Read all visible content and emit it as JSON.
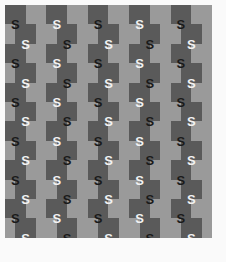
{
  "figure": {
    "width": 226,
    "height": 262,
    "background_color": "#fafafa"
  },
  "pattern": {
    "origin_x": 5,
    "origin_y": 5,
    "width": 207,
    "height": 233,
    "cell_width": 20.7,
    "cell_height": 19.4,
    "columns": 10,
    "rows": 12,
    "row_shift_px": 10.35,
    "colors": {
      "light_square": "#9a9a9a",
      "dark_square": "#5a5a5a",
      "glyph_dark": "#1a1a1a",
      "glyph_light": "#f2f2f2"
    }
  },
  "glyph": {
    "character": "S",
    "font_size_px": 13,
    "columns": 10,
    "rows": 12,
    "labels": [
      [
        "S",
        "S",
        "S",
        "S",
        "S",
        "S",
        "S",
        "S",
        "S",
        "S"
      ],
      [
        "S",
        "S",
        "S",
        "S",
        "S",
        "S",
        "S",
        "S",
        "S",
        "S"
      ],
      [
        "S",
        "S",
        "S",
        "S",
        "S",
        "S",
        "S",
        "S",
        "S",
        "S"
      ],
      [
        "S",
        "S",
        "S",
        "S",
        "S",
        "S",
        "S",
        "S",
        "S",
        "S"
      ],
      [
        "S",
        "S",
        "S",
        "S",
        "S",
        "S",
        "S",
        "S",
        "S",
        "S"
      ],
      [
        "S",
        "S",
        "S",
        "S",
        "S",
        "S",
        "S",
        "S",
        "S",
        "S"
      ],
      [
        "S",
        "S",
        "S",
        "S",
        "S",
        "S",
        "S",
        "S",
        "S",
        "S"
      ],
      [
        "S",
        "S",
        "S",
        "S",
        "S",
        "S",
        "S",
        "S",
        "S",
        "S"
      ],
      [
        "S",
        "S",
        "S",
        "S",
        "S",
        "S",
        "S",
        "S",
        "S",
        "S"
      ],
      [
        "S",
        "S",
        "S",
        "S",
        "S",
        "S",
        "S",
        "S",
        "S",
        "S"
      ],
      [
        "S",
        "S",
        "S",
        "S",
        "S",
        "S",
        "S",
        "S",
        "S",
        "S"
      ],
      [
        "S",
        "S",
        "S",
        "S",
        "S",
        "S",
        "S",
        "S",
        "S",
        "S"
      ]
    ]
  }
}
